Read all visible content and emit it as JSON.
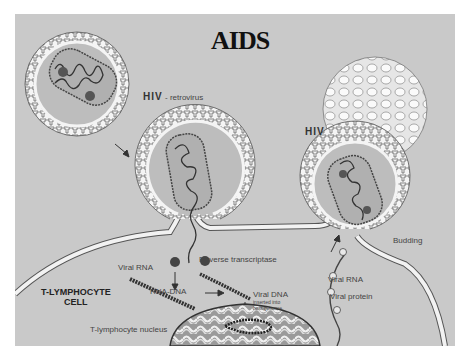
{
  "title": "AIDS",
  "labels": {
    "hiv_retrovirus_bold": "HIV",
    "hiv_retrovirus_desc": "- retrovirus",
    "hiv_budding": "HIV",
    "budding": "Budding",
    "reverse_transcriptase": "Reverse transcriptase",
    "viral_rna_left": "Viral RNA",
    "rna_dna": "RNA-DNA",
    "viral_dna": "Viral DNA",
    "viral_dna_note_1": "inserted into",
    "viral_dna_note_2": "host genome",
    "viral_rna_right": "Viral RNA",
    "viral_protein": "Viral protein",
    "cell_name_1": "T-LYMPHOCYTE",
    "cell_name_2": "CELL",
    "nucleus": "T-lymphocyte nucleus"
  },
  "colors": {
    "background": "#c9c9c9",
    "membrane": "#f2f2f2",
    "outline": "#555555",
    "strand": "#333333",
    "capsid_fill": "#b5b5b5"
  }
}
